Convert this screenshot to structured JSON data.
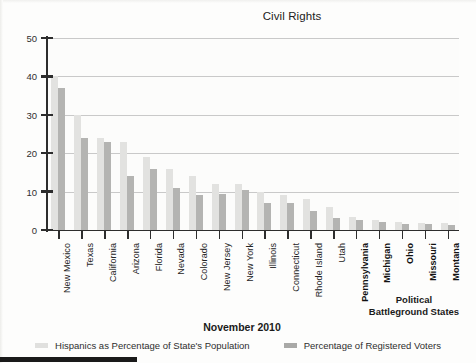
{
  "chart_data": {
    "type": "bar",
    "title": "Civil Rights",
    "xlabel": "",
    "ylabel": "",
    "ylim": [
      0,
      50
    ],
    "yticks": [
      0,
      10,
      20,
      30,
      40,
      50
    ],
    "grid": true,
    "legend_position": "bottom",
    "categories": [
      "New Mexico",
      "Texas",
      "California",
      "Arizona",
      "Florida",
      "Nevada",
      "Colorado",
      "New Jersey",
      "New York",
      "Illinois",
      "Connecticut",
      "Rhode Island",
      "Utah",
      "Pennsylvania",
      "Michigan",
      "Ohio",
      "Missouri",
      "Montana"
    ],
    "series": [
      {
        "name": "Hispanics as Percentage of State's Population",
        "color": "#e2e2e0",
        "values": [
          40,
          30,
          24,
          23,
          19,
          16,
          14,
          12,
          12,
          10,
          9,
          8,
          6,
          3.5,
          2.5,
          2,
          1.8,
          1.8
        ]
      },
      {
        "name": "Percentage of Registered Voters",
        "color": "#b4b4b2",
        "values": [
          37,
          24,
          23,
          14,
          16,
          11,
          9,
          9.5,
          10.5,
          7,
          7,
          5,
          3,
          2.5,
          2,
          1.5,
          1.5,
          1.2
        ]
      }
    ],
    "annotations": [
      {
        "name": "battleground",
        "text_line_1": "Political",
        "text_line_2": "Battleground States",
        "applies_to": [
          "Pennsylvania",
          "Michigan",
          "Ohio",
          "Missouri",
          "Montana"
        ]
      }
    ],
    "bold_categories": [
      "Pennsylvania",
      "Michigan",
      "Ohio",
      "Missouri",
      "Montana"
    ],
    "footer_date": "November 2010"
  },
  "footer": {
    "date": "November 2010"
  },
  "legend": {
    "items": [
      {
        "label": "Hispanics as Percentage of State's Population"
      },
      {
        "label": "Percentage of Registered Voters"
      }
    ]
  },
  "annotation": {
    "line1": "Political",
    "line2": "Battleground States"
  },
  "colors": {
    "population_bar": "#e2e2e0",
    "voters_bar": "#b4b4b2",
    "axis": "#2d2d2d",
    "grid": "#c9c9c9"
  }
}
